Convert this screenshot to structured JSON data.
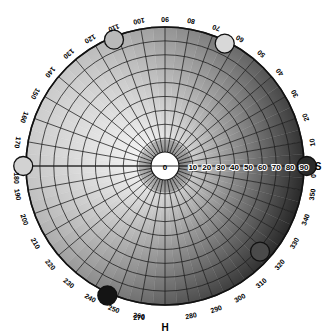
{
  "chart_data": {
    "type": "scatter",
    "subtype": "polar-hsv-wheel",
    "title": "",
    "angular_axis": {
      "label": "H",
      "unit": "degrees",
      "range": [
        0,
        360
      ],
      "tick_step": 10,
      "direction": "counterclockwise",
      "zero_at": "right",
      "tick_labels": [
        "0",
        "10",
        "20",
        "30",
        "40",
        "50",
        "60",
        "70",
        "80",
        "90",
        "100",
        "110",
        "120",
        "130",
        "140",
        "150",
        "160",
        "170",
        "180",
        "190",
        "200",
        "210",
        "220",
        "230",
        "240",
        "250",
        "260",
        "270",
        "280",
        "290",
        "300",
        "310",
        "320",
        "330",
        "340",
        "350"
      ]
    },
    "radial_axis": {
      "label": "S",
      "range": [
        0,
        90
      ],
      "tick_step": 10,
      "tick_labels": [
        "0",
        "10",
        "20",
        "30",
        "40",
        "50",
        "60",
        "70",
        "80",
        "90"
      ],
      "center_label": "0"
    },
    "grid": true,
    "legend": false,
    "background_type": "grayscale-hue-saturation-gradient",
    "points": [
      {
        "name": "marker-1",
        "h": 112,
        "s": 88,
        "fill": "#b9b9b9"
      },
      {
        "name": "marker-2",
        "h": 64,
        "s": 88,
        "fill": "#d8d8d8"
      },
      {
        "name": "marker-3",
        "h": 180,
        "s": 92,
        "fill": "#d2d2d2"
      },
      {
        "name": "marker-4",
        "h": 0,
        "s": 92,
        "fill": "#2a2a2a"
      },
      {
        "name": "marker-5",
        "h": 318,
        "s": 82,
        "fill": "#4a4a4a"
      },
      {
        "name": "marker-6",
        "h": 246,
        "s": 92,
        "fill": "#141414"
      }
    ]
  },
  "axes": {
    "hue_label": "H",
    "saturation_label": "S"
  },
  "geometry": {
    "cx": 165,
    "cy": 166,
    "outer_radius": 139,
    "inner_radius": 14
  }
}
